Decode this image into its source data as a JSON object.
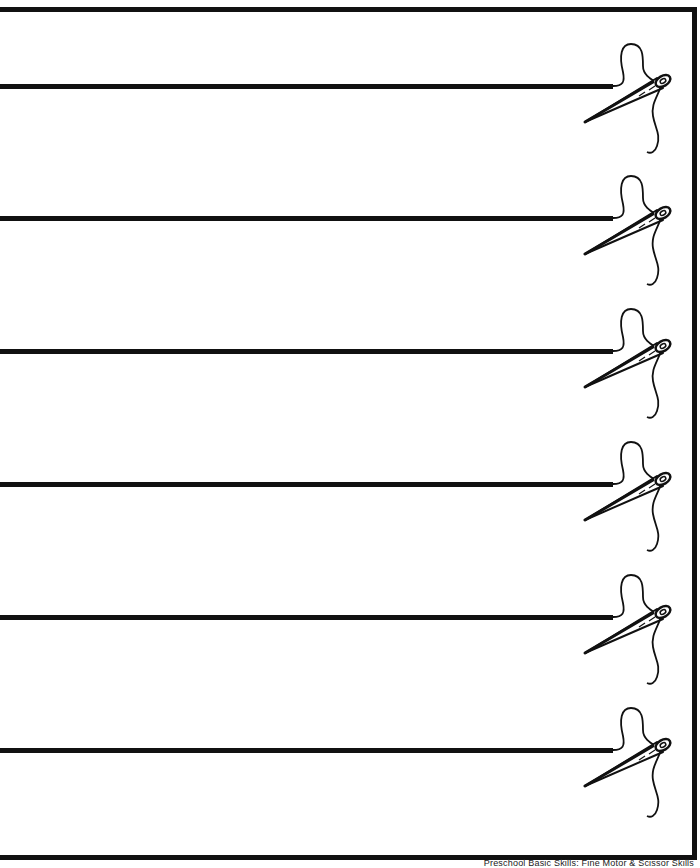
{
  "worksheet": {
    "activity": "cut-along-lines",
    "rows": [
      {
        "line_y": 86,
        "line_end_x": 613
      },
      {
        "line_y": 218,
        "line_end_x": 613
      },
      {
        "line_y": 351,
        "line_end_x": 613
      },
      {
        "line_y": 484,
        "line_end_x": 613
      },
      {
        "line_y": 617,
        "line_end_x": 613
      },
      {
        "line_y": 750,
        "line_end_x": 613
      }
    ],
    "icon": "needle-and-thread-icon",
    "colors": {
      "ink": "#111111",
      "paper": "#ffffff"
    }
  },
  "footer": {
    "text": "Preschool Basic Skills: Fine Motor & Scissor Skills"
  }
}
